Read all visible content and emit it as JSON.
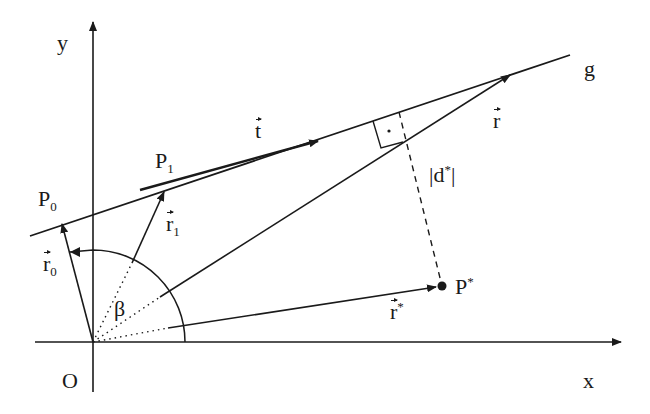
{
  "figure": {
    "colors": {
      "ink": "#1a1a1a",
      "background": "#ffffff"
    }
  },
  "labels": {
    "y_axis": "y",
    "x_axis": "x",
    "origin": "O",
    "line": "g",
    "p0": {
      "base": "P",
      "sub": "0"
    },
    "p1": {
      "base": "P",
      "sub": "1"
    },
    "pstar": {
      "base": "P",
      "sup": "*"
    },
    "t_vec": "t",
    "r_vec": "r",
    "r0_vec": {
      "base": "r",
      "sub": "0"
    },
    "r1_vec": {
      "base": "r",
      "sub": "1"
    },
    "rstar_vec": {
      "base": "r",
      "sup": "*"
    },
    "distance": {
      "open": "|d",
      "sup": "*",
      "close": "|"
    },
    "angle": "β"
  },
  "geometry": {
    "origin": [
      93,
      342
    ],
    "x_axis": {
      "from": [
        35,
        342
      ],
      "to": [
        621,
        342
      ]
    },
    "y_axis": {
      "from": [
        93,
        392
      ],
      "to": [
        93,
        22
      ]
    },
    "line_g": {
      "from": [
        30,
        236
      ],
      "to": [
        570,
        55
      ]
    },
    "points": {
      "P0": [
        62,
        223
      ],
      "P1": [
        140,
        190
      ],
      "Pstar": [
        442,
        286
      ],
      "foot": [
        403,
        142
      ]
    },
    "arc_radius": 92
  }
}
